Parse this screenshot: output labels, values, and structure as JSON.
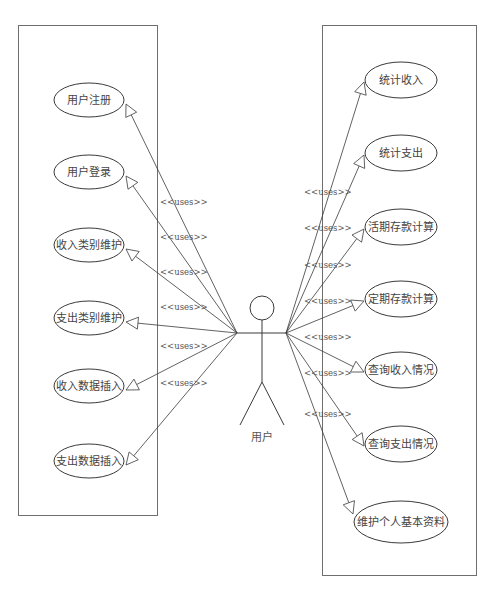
{
  "diagram": {
    "type": "uml-use-case",
    "actor": {
      "label": "用户",
      "head": {
        "cx": 262,
        "cy": 308,
        "r": 12
      },
      "left_hand": [
        237,
        333
      ],
      "right_hand": [
        286,
        333
      ]
    },
    "stereotype_label": "<<uses>>",
    "left_system_box": {
      "x": 18,
      "y": 25,
      "w": 139,
      "h": 490
    },
    "right_system_box": {
      "x": 322,
      "y": 25,
      "w": 154,
      "h": 550
    },
    "left_use_cases": [
      {
        "label": "用户注册",
        "cx": 89,
        "cy": 100,
        "rx": 35,
        "ry": 17
      },
      {
        "label": "用户登录",
        "cx": 89,
        "cy": 172,
        "rx": 35,
        "ry": 17
      },
      {
        "label": "收入类别维护",
        "cx": 89,
        "cy": 245,
        "rx": 35,
        "ry": 17
      },
      {
        "label": "支出类别维护",
        "cx": 89,
        "cy": 318,
        "rx": 35,
        "ry": 17
      },
      {
        "label": "收入数据插入",
        "cx": 89,
        "cy": 386,
        "rx": 35,
        "ry": 17
      },
      {
        "label": "支出数据插入",
        "cx": 89,
        "cy": 461,
        "rx": 35,
        "ry": 17
      }
    ],
    "right_use_cases": [
      {
        "label": "统计收入",
        "cx": 401,
        "cy": 80,
        "rx": 36,
        "ry": 18
      },
      {
        "label": "统计支出",
        "cx": 401,
        "cy": 153,
        "rx": 36,
        "ry": 18
      },
      {
        "label": "活期存款计算",
        "cx": 401,
        "cy": 227,
        "rx": 36,
        "ry": 18
      },
      {
        "label": "定期存款计算",
        "cx": 401,
        "cy": 299,
        "rx": 36,
        "ry": 18
      },
      {
        "label": "查询收入情况",
        "cx": 401,
        "cy": 370,
        "rx": 36,
        "ry": 18
      },
      {
        "label": "查询支出情况",
        "cx": 401,
        "cy": 444,
        "rx": 36,
        "ry": 18
      },
      {
        "label": "维护个人基本资料",
        "cx": 401,
        "cy": 522,
        "rx": 47,
        "ry": 21
      }
    ],
    "left_uses_label_positions": [
      {
        "x": 160,
        "y": 202
      },
      {
        "x": 160,
        "y": 237
      },
      {
        "x": 160,
        "y": 272
      },
      {
        "x": 160,
        "y": 307
      },
      {
        "x": 160,
        "y": 346
      },
      {
        "x": 160,
        "y": 383
      }
    ],
    "right_uses_label_positions": [
      {
        "x": 304,
        "y": 192
      },
      {
        "x": 304,
        "y": 228
      },
      {
        "x": 304,
        "y": 265
      },
      {
        "x": 304,
        "y": 301
      },
      {
        "x": 304,
        "y": 337
      },
      {
        "x": 304,
        "y": 373
      },
      {
        "x": 304,
        "y": 414
      }
    ],
    "colors": {
      "line": "#3a3a3a",
      "box": "#6e6e6e",
      "text": "#444444",
      "background": "#ffffff"
    }
  }
}
